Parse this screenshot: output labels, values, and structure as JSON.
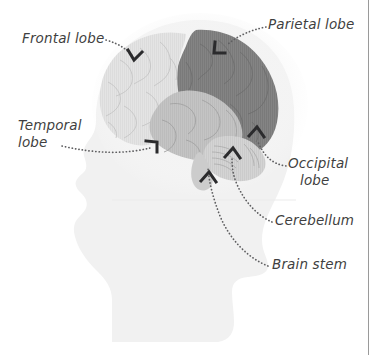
{
  "figure": {
    "kind": "anatomical-diagram",
    "background_color": "#ffffff",
    "width": 382,
    "height": 355
  },
  "labels": {
    "frontal": "Frontal lobe",
    "parietal": "Parietal lobe",
    "temporal_line1": "Temporal",
    "temporal_line2": "lobe",
    "occipital_line1": "Occipital",
    "occipital_line2": "lobe",
    "cerebellum": "Cerebellum",
    "brain_stem": "Brain stem"
  },
  "regions": [
    {
      "name": "head-silhouette",
      "label": "",
      "fill": "#f1f1f1"
    },
    {
      "name": "frontal-lobe",
      "label": "Frontal lobe",
      "fill": "#e2e2e2"
    },
    {
      "name": "parietal-occipital-lobe",
      "label": "Parietal lobe",
      "fill": "#818181"
    },
    {
      "name": "temporal-lobe",
      "label": "Temporal lobe",
      "fill": "#c2c2c2"
    },
    {
      "name": "cerebellum",
      "label": "Cerebellum",
      "fill": "#d2d2d2"
    },
    {
      "name": "brain-stem",
      "label": "Brain stem",
      "fill": "#cccccc"
    }
  ],
  "colors": {
    "text": "#3f3f41",
    "leader_line": "#6a6a6c",
    "arrow": "#2b2b2d",
    "rule": "#9a9a9a",
    "page_background": "#ffffff"
  },
  "leaders": [
    {
      "name": "leader-frontal",
      "from_label": "Frontal lobe",
      "to_region": "frontal-lobe"
    },
    {
      "name": "leader-parietal",
      "from_label": "Parietal lobe",
      "to_region": "parietal-occipital-lobe"
    },
    {
      "name": "leader-temporal",
      "from_label": "Temporal lobe",
      "to_region": "temporal-lobe"
    },
    {
      "name": "leader-occipital",
      "from_label": "Occipital lobe",
      "to_region": "parietal-occipital-lobe"
    },
    {
      "name": "leader-cerebellum",
      "from_label": "Cerebellum",
      "to_region": "cerebellum"
    },
    {
      "name": "leader-brainstem",
      "from_label": "Brain stem",
      "to_region": "brain-stem"
    }
  ]
}
